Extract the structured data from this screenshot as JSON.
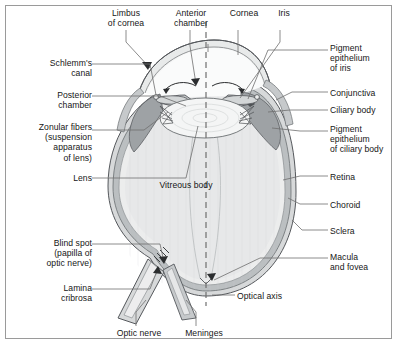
{
  "figure": {
    "labels_left": [
      {
        "id": "schlemms-canal",
        "text": "Schlemm's\ncanal",
        "x": 14,
        "y": 58,
        "w": 78
      },
      {
        "id": "posterior-chamber",
        "text": "Posterior\nchamber",
        "x": 14,
        "y": 90,
        "w": 78
      },
      {
        "id": "zonular-fibers",
        "text": "Zonular fibers\n(suspension\napparatus\nof lens)",
        "x": 6,
        "y": 122,
        "w": 86
      },
      {
        "id": "lens",
        "text": "Lens",
        "x": 48,
        "y": 173,
        "w": 44
      }
    ],
    "labels_top": [
      {
        "id": "limbus-of-cornea",
        "text": "Limbus\nof cornea",
        "x": 98,
        "y": 8,
        "w": 56
      },
      {
        "id": "anterior-chamber",
        "text": "Anterior\nchamber",
        "x": 163,
        "y": 8,
        "w": 56
      },
      {
        "id": "cornea",
        "text": "Cornea",
        "x": 222,
        "y": 8,
        "w": 44
      },
      {
        "id": "iris",
        "text": "Iris",
        "x": 270,
        "y": 8,
        "w": 28
      }
    ],
    "labels_right": [
      {
        "id": "pigment-epithelium-of-iris",
        "text": "Pigment\nepithelium\nof iris",
        "x": 330,
        "y": 43,
        "w": 68
      },
      {
        "id": "conjunctiva",
        "text": "Conjunctiva",
        "x": 330,
        "y": 88,
        "w": 68
      },
      {
        "id": "ciliary-body",
        "text": "Ciliary body",
        "x": 330,
        "y": 105,
        "w": 68
      },
      {
        "id": "pigment-epithelium-of-ciliary-body",
        "text": "Pigment\nepithelium\nof ciliary body",
        "x": 330,
        "y": 124,
        "w": 70
      },
      {
        "id": "retina",
        "text": "Retina",
        "x": 330,
        "y": 172,
        "w": 60
      },
      {
        "id": "choroid",
        "text": "Choroid",
        "x": 330,
        "y": 200,
        "w": 60
      },
      {
        "id": "sclera",
        "text": "Sclera",
        "x": 330,
        "y": 226,
        "w": 60
      },
      {
        "id": "macula-and-fovea",
        "text": "Macula\nand fovea",
        "x": 330,
        "y": 252,
        "w": 64
      },
      {
        "id": "optical-axis",
        "text": "Optical axis",
        "x": 237,
        "y": 291,
        "w": 66
      }
    ],
    "labels_bottom_left": [
      {
        "id": "blind-spot",
        "text": "Blind spot\n(papilla of\noptic nerve)",
        "x": 14,
        "y": 238,
        "w": 78
      },
      {
        "id": "lamina-cribrosa",
        "text": "Lamina\ncribrosa",
        "x": 14,
        "y": 283,
        "w": 78
      }
    ],
    "labels_bottom": [
      {
        "id": "optic-nerve",
        "text": "Optic nerve",
        "x": 108,
        "y": 328,
        "w": 62
      },
      {
        "id": "meninges",
        "text": "Meninges",
        "x": 176,
        "y": 328,
        "w": 56
      }
    ],
    "labels_inner": [
      {
        "id": "vitreous-body",
        "text": "Vitreous body",
        "x": 148,
        "y": 180,
        "w": 76
      }
    ],
    "colors": {
      "frame": "#9a9a9a",
      "background": "#ffffff",
      "leader": "#6f6f6f",
      "outline": "#55585c",
      "sclera": "#d7d9da",
      "choroid": "#a9acae",
      "retina": "#ecedee",
      "vitreous": "#e9eaeb",
      "lens": "#f4f5f5",
      "ciliary_body": "#9b9fa2",
      "iris": "#b8bcbe",
      "cornea": "#e4e6e7",
      "text": "#161616"
    }
  }
}
